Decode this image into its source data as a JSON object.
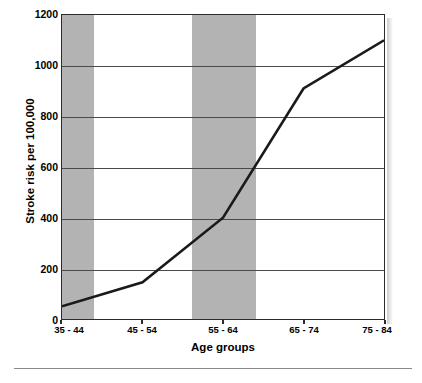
{
  "chart_data": {
    "type": "line",
    "title": "",
    "xlabel": "Age groups",
    "ylabel": "Stroke risk per 100,000",
    "categories": [
      "35 - 44",
      "45 - 54",
      "55 - 64",
      "65 - 74",
      "75 - 84"
    ],
    "values": [
      50,
      145,
      400,
      910,
      1100
    ],
    "series": [
      {
        "name": "Stroke risk",
        "values": [
          50,
          145,
          400,
          910,
          1100
        ]
      }
    ],
    "ylim": [
      0,
      1200
    ],
    "yticks": [
      0,
      200,
      400,
      600,
      800,
      1000,
      1200
    ],
    "ytick_labels": [
      "0",
      "200",
      "400",
      "600",
      "800",
      "1000",
      "1200"
    ],
    "grid": true,
    "grid_axis": "y",
    "legend": "none",
    "banding": {
      "enabled": true,
      "description": "alternating shaded vertical bands behind categories",
      "shaded_categories": [
        "35 - 44",
        "55 - 64"
      ],
      "band_color": "#b3b3b3"
    },
    "colors": {
      "line": "#1a1a1a",
      "background": "#ffffff",
      "band": "#b3b3b3",
      "grid": "#4a4a4a",
      "axis": "#2b2b2b",
      "text": "#000000"
    },
    "line_width": 2.6
  },
  "caption": {
    "text": ""
  }
}
